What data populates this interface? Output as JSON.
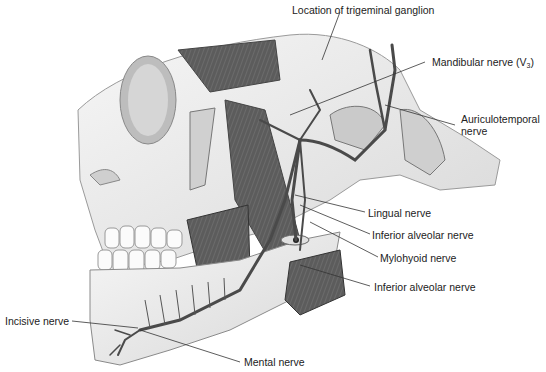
{
  "figure": {
    "labels": {
      "trigeminal_ganglion": "Location of trigeminal ganglion",
      "mandibular_nerve": "Mandibular nerve (V",
      "mandibular_nerve_sub": "3",
      "mandibular_nerve_close": ")",
      "auriculotemporal_line1": "Auriculotemporal",
      "auriculotemporal_line2": "nerve",
      "lingual": "Lingual nerve",
      "inferior_alveolar_1": "Inferior alveolar nerve",
      "mylohyoid": "Mylohyoid nerve",
      "inferior_alveolar_2": "Inferior alveolar nerve",
      "incisive": "Incisive nerve",
      "mental": "Mental nerve"
    },
    "colors": {
      "nerve": "#4a4a4a",
      "bone": "#ececec",
      "bone_shadow": "#c8c8c8",
      "muscle": "#5a5a5a",
      "leader_line": "#333333",
      "text": "#222222"
    }
  }
}
